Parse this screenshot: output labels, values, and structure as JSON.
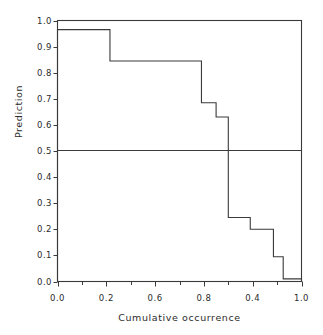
{
  "chart_data": {
    "type": "line",
    "title": "",
    "xlabel": "Cumulative occurrence",
    "ylabel": "Prediction",
    "xlim": [
      0.0,
      1.0
    ],
    "ylim": [
      0.0,
      1.0
    ],
    "grid": false,
    "legend": null,
    "style": "step-post",
    "annotations": [
      {
        "name": "midline",
        "orientation": "horizontal",
        "y": 0.5
      }
    ],
    "xtick_labels": [
      "0.0",
      "0.2",
      "0.6",
      "0.8",
      "0.4",
      "1.0"
    ],
    "xtick_positions": [
      0.0,
      0.2,
      0.4,
      0.6,
      0.8,
      1.0
    ],
    "xminor_count": 1,
    "ytick_labels": [
      "0.0",
      "0.1",
      "0.2",
      "0.3",
      "0.4",
      "0.5",
      "0.6",
      "0.7",
      "0.8",
      "0.9",
      "1.0"
    ],
    "ytick_positions": [
      0.0,
      0.1,
      0.2,
      0.3,
      0.4,
      0.5,
      0.6,
      0.7,
      0.8,
      0.9,
      1.0
    ],
    "x_edges": [
      0.0,
      0.215,
      0.59,
      0.65,
      0.7,
      0.79,
      0.885,
      0.925,
      1.0
    ],
    "values": [
      0.965,
      0.845,
      0.685,
      0.63,
      0.245,
      0.2,
      0.095,
      0.01
    ],
    "x": [
      0.0,
      0.215,
      0.59,
      0.65,
      0.7,
      0.79,
      0.885,
      0.925
    ],
    "series": [
      {
        "name": "prediction",
        "values": [
          0.965,
          0.845,
          0.685,
          0.63,
          0.245,
          0.2,
          0.095,
          0.01
        ]
      }
    ]
  }
}
